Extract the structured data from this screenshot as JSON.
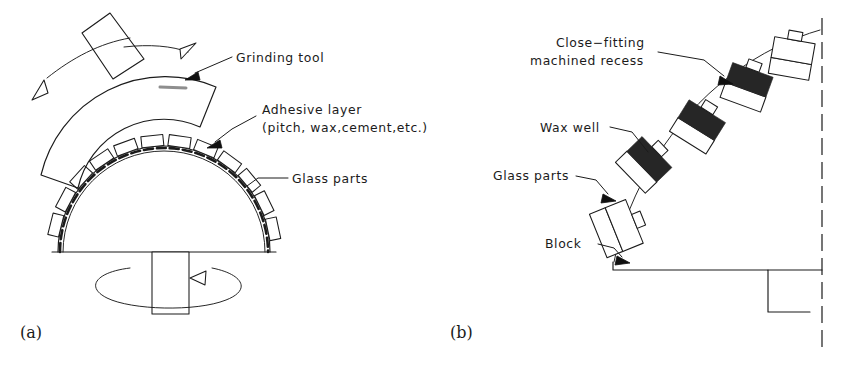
{
  "figure": {
    "background_color": "#ffffff",
    "ink_color": "#1b1b1b",
    "panels": [
      {
        "caption": "(a)",
        "name": "rotating-dome-grinding-setup",
        "labels": [
          {
            "id": "grinding-tool",
            "text": "Grinding tool"
          },
          {
            "id": "adhesive-layer",
            "text": "Adhesive layer"
          },
          {
            "id": "adhesive-layer-detail",
            "text": "(pitch, wax,cement,etc.)"
          },
          {
            "id": "glass-parts",
            "text": "Glass parts"
          }
        ],
        "motion": [
          {
            "id": "tool-oscillation",
            "description": "double-headed arc arrow over grinding tool"
          },
          {
            "id": "spindle-rotation",
            "description": "elliptical rotation arrow around spindle"
          }
        ]
      },
      {
        "caption": "(b)",
        "name": "blocked-parts-detail",
        "labels": [
          {
            "id": "close-fitting-recess-line1",
            "text": "Close−fitting"
          },
          {
            "id": "close-fitting-recess-line2",
            "text": "machined recess"
          },
          {
            "id": "wax-well",
            "text": "Wax well"
          },
          {
            "id": "glass-parts",
            "text": "Glass parts"
          },
          {
            "id": "block",
            "text": "Block"
          }
        ],
        "block_count": 5
      }
    ]
  }
}
